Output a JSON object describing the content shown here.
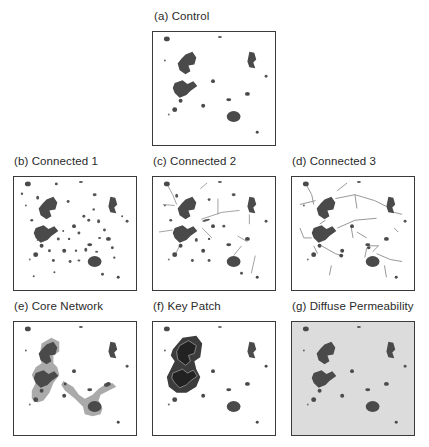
{
  "figure": {
    "panels": [
      {
        "id": "a",
        "title": "(a) Control",
        "scenario": "control"
      },
      {
        "id": "b",
        "title": "(b) Connected 1",
        "scenario": "connected-1"
      },
      {
        "id": "c",
        "title": "(c) Connected 2",
        "scenario": "connected-2"
      },
      {
        "id": "d",
        "title": "(d) Connected 3",
        "scenario": "connected-3"
      },
      {
        "id": "e",
        "title": "(e) Core Network",
        "scenario": "core-network"
      },
      {
        "id": "f",
        "title": "(f) Key Patch",
        "scenario": "key-patch"
      },
      {
        "id": "g",
        "title": "(g) Diffuse Permeability",
        "scenario": "diffuse-permeability"
      }
    ]
  },
  "colors": {
    "patch": "#4a4a4a",
    "corridor": "#8a8a8a",
    "buffer": "#aaaaaa",
    "key_patch_buffer": "#3c3c3c",
    "key_patch_core": "#222222",
    "frame": "#3a3a3a",
    "diffuse_background": "#dcdcdc"
  }
}
